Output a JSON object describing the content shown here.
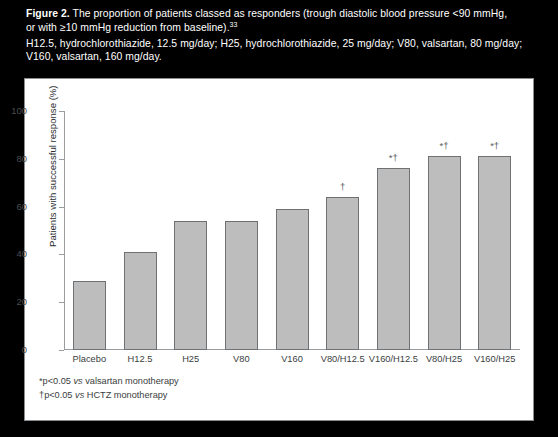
{
  "figure": {
    "label": "Figure 2.",
    "caption_line1": "The proportion of patients classed as responders (trough diastolic blood pressure <90 mmHg,",
    "caption_line2_pre": "or with ≥10 mmHg reduction from baseline).",
    "caption_reference": "33",
    "abbrev_line1": "H12.5, hydrochlorothiazide, 12.5 mg/day; H25, hydrochlorothiazide, 25 mg/day; V80, valsartan, 80 mg/day;",
    "abbrev_line2": "V160, valsartan, 160 mg/day."
  },
  "footnotes": [
    {
      "marker": "*",
      "text_pre": "p<0.05 ",
      "text_it": "vs",
      "text_post": " valsartan monotherapy"
    },
    {
      "marker": "†",
      "text_pre": "p<0.05 ",
      "text_it": "vs",
      "text_post": " HCTZ monotherapy"
    }
  ],
  "colors": {
    "bar_fill": "#bdbdbd",
    "bar_border": "#6f7275",
    "axis": "#9a9da0",
    "header_bg": "#000000",
    "header_text": "#ffffff",
    "panel_border": "#8a8d90"
  },
  "chart_data": {
    "type": "bar",
    "title": "The proportion of patients classed as responders",
    "xlabel": "",
    "ylabel": "Patients with successful response (%)",
    "ylim": [
      0,
      100
    ],
    "yticks": [
      0,
      20,
      40,
      60,
      80,
      100
    ],
    "grid": false,
    "legend": "none",
    "categories": [
      "Placebo",
      "H12.5",
      "H25",
      "V80",
      "V160",
      "V80/H12.5",
      "V160/H12.5",
      "V80/H25",
      "V160/H25"
    ],
    "values": [
      29,
      41,
      54,
      54,
      59,
      64,
      76,
      81,
      81
    ],
    "annotations": [
      "",
      "",
      "",
      "",
      "",
      "†",
      "*†",
      "*†",
      "*†"
    ]
  }
}
